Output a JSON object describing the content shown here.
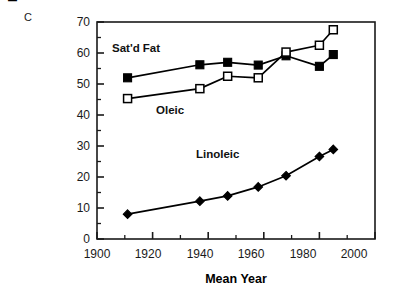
{
  "panel": {
    "letter": "C"
  },
  "axes": {
    "ylabel_line1": "Fatty Acid Consumption",
    "ylabel_line2": "Trends (g/day)",
    "xlabel": "Mean Year",
    "ytick_labels": [
      "0",
      "10",
      "20",
      "30",
      "40",
      "50",
      "60",
      "70"
    ],
    "xtick_labels": [
      "1900",
      "1920",
      "1940",
      "1960",
      "1980",
      "2000"
    ]
  },
  "series_labels": {
    "satd_fat": "Sat'd Fat",
    "oleic": "Oleic",
    "linoleic": "Linoleic"
  },
  "colors": {
    "line": "#000000",
    "filled_marker": "#000000",
    "open_marker_fill": "#ffffff",
    "axis": "#1a1a1a",
    "background": "#ffffff"
  },
  "chart_data": {
    "type": "line",
    "title": "",
    "panel_letter": "C",
    "xlabel": "Mean Year",
    "ylabel": "Fatty Acid Consumption Trends (g/day)",
    "xlim": [
      1900,
      2000
    ],
    "ylim": [
      0,
      70
    ],
    "xticks": [
      1900,
      1920,
      1940,
      1960,
      1980,
      2000
    ],
    "yticks": [
      0,
      10,
      20,
      30,
      40,
      50,
      60,
      70
    ],
    "xminor_ticks": [
      1910,
      1930,
      1950,
      1970,
      1990
    ],
    "yminor_ticks": [
      5,
      15,
      25,
      35,
      45,
      55,
      65
    ],
    "grid": false,
    "legend": "inline-labels",
    "x": [
      1911,
      1937,
      1947,
      1958,
      1968,
      1980,
      1985
    ],
    "series": [
      {
        "name": "Sat'd Fat",
        "marker": "filled-square",
        "values": [
          52.0,
          56.2,
          57.0,
          56.1,
          59.1,
          55.7,
          59.5
        ]
      },
      {
        "name": "Oleic",
        "marker": "open-square",
        "values": [
          45.3,
          48.5,
          52.5,
          52.0,
          60.3,
          62.5,
          67.5
        ]
      },
      {
        "name": "Linoleic",
        "marker": "filled-diamond",
        "values": [
          8.0,
          12.2,
          13.9,
          16.8,
          20.4,
          26.6,
          28.9
        ]
      }
    ],
    "annotations": [
      {
        "text": "Sat'd Fat",
        "x": 1912,
        "y": 61.5
      },
      {
        "text": "Oleic",
        "x": 1930,
        "y": 41.5
      },
      {
        "text": "Linoleic",
        "x": 1945,
        "y": 31.5
      }
    ]
  }
}
